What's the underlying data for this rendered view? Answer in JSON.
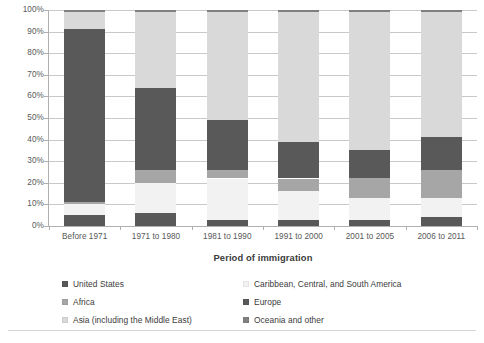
{
  "chart_data": {
    "type": "bar",
    "subtype": "stacked-100-percent",
    "title": "",
    "xlabel": "Period of immigration",
    "ylabel": "",
    "ylim": [
      0,
      100
    ],
    "ytick_labels": [
      "100%",
      "90%",
      "80%",
      "70%",
      "60%",
      "50%",
      "40%",
      "30%",
      "20%",
      "10%",
      "0%"
    ],
    "ytick_values": [
      100,
      90,
      80,
      70,
      60,
      50,
      40,
      30,
      20,
      10,
      0
    ],
    "grid": true,
    "legend_position": "bottom",
    "categories": [
      "Before 1971",
      "1971 to 1980",
      "1981 to 1990",
      "1991 to 2000",
      "2001 to 2005",
      "2006 to 2011"
    ],
    "series": [
      {
        "name": "United States",
        "color": "#595959",
        "values": [
          5,
          6,
          3,
          3,
          3,
          4
        ]
      },
      {
        "name": "Caribbean, Central, and South America",
        "color": "#f2f2f2",
        "values": [
          5,
          14,
          19,
          13,
          10,
          9
        ]
      },
      {
        "name": "Africa",
        "color": "#a6a6a6",
        "values": [
          1,
          6,
          4,
          6,
          9,
          13
        ]
      },
      {
        "name": "Europe",
        "color": "#595959",
        "values": [
          80,
          38,
          23,
          17,
          13,
          15
        ]
      },
      {
        "name": "Asia (including the Middle East)",
        "color": "#d9d9d9",
        "values": [
          8,
          35,
          50,
          60,
          64,
          58
        ]
      },
      {
        "name": "Oceania and other",
        "color": "#808080",
        "values": [
          1,
          1,
          1,
          1,
          1,
          1
        ]
      }
    ]
  },
  "legend": {
    "columns": [
      {
        "items": [
          {
            "label": "United States",
            "color": "#595959"
          },
          {
            "label": "Africa",
            "color": "#a6a6a6"
          },
          {
            "label": "Asia (including the Middle East)",
            "color": "#d9d9d9"
          }
        ]
      },
      {
        "items": [
          {
            "label": "Caribbean, Central, and South America",
            "color": "#f2f2f2"
          },
          {
            "label": "Europe",
            "color": "#595959"
          },
          {
            "label": "Oceania and other",
            "color": "#808080"
          }
        ]
      }
    ]
  },
  "colors": {
    "gridline": "#c9c9c9",
    "axis": "#b0b0b0",
    "text": "#3b3b3b",
    "tick_text": "#585858",
    "background": "#ffffff"
  }
}
